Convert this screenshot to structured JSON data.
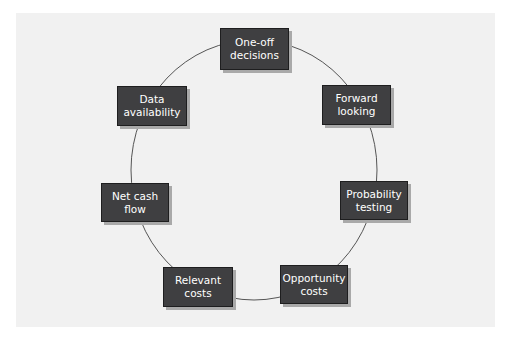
{
  "diagram": {
    "type": "cycle",
    "nodes": [
      {
        "id": "one-off-decisions",
        "label": "One-off decisions"
      },
      {
        "id": "forward-looking",
        "label": "Forward looking"
      },
      {
        "id": "probability-testing",
        "label": "Probability testing"
      },
      {
        "id": "opportunity-costs",
        "label": "Opportunity costs"
      },
      {
        "id": "relevant-costs",
        "label": "Relevant costs"
      },
      {
        "id": "net-cash-flow",
        "label": "Net cash flow"
      },
      {
        "id": "data-availability",
        "label": "Data availability"
      }
    ],
    "connector": "circle",
    "colors": {
      "node_fill": "#3f3f41",
      "node_text": "#ffffff",
      "background": "#f1f1f1",
      "ring": "#555555"
    }
  },
  "caption": ""
}
